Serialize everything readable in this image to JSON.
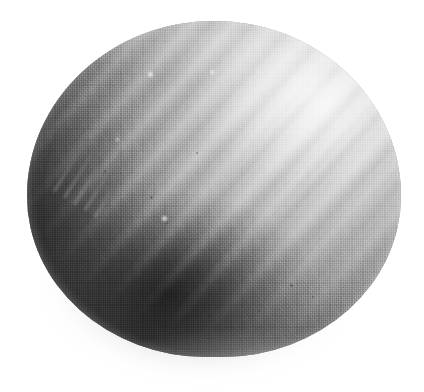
{
  "image": {
    "domain": "Natural-Image",
    "description": "Close-up photograph of a rounded dome-shaped object with a woven textile surface",
    "width": 424,
    "height": 392,
    "background_color": "#ffffff",
    "color_mode": "grayscale"
  },
  "subject": {
    "name": "textured dome object",
    "shape": "dome",
    "bounds": {
      "left": 27,
      "top": 21,
      "width": 374,
      "height": 336
    },
    "surface": "fine woven crosshatch mesh",
    "base_color": "#9a9a9a",
    "highlight_color": "#ececec",
    "shadow_color": "#2a2a2a",
    "deepest_shadow_color": "#121212"
  },
  "lighting": {
    "direction": "upper-right",
    "highlight_center": {
      "x": 310,
      "y": 92
    },
    "shadow_center": {
      "x": 165,
      "y": 292
    },
    "ambient_shadow_color": "#5a5a5a"
  },
  "ridges": {
    "count": 5,
    "angle_degrees": 132,
    "spacing_px": 31,
    "region": "upper-middle to right of the dome"
  },
  "markings": {
    "embossed_lines": 5,
    "legible": false,
    "location": "left flank",
    "rotation_degrees": -58
  },
  "speckles": [
    {
      "x": 150,
      "y": 196,
      "size": 3
    },
    {
      "x": 166,
      "y": 222,
      "size": 2
    },
    {
      "x": 290,
      "y": 284,
      "size": 3
    },
    {
      "x": 312,
      "y": 296,
      "size": 2
    },
    {
      "x": 196,
      "y": 152,
      "size": 2
    },
    {
      "x": 258,
      "y": 310,
      "size": 2
    },
    {
      "x": 104,
      "y": 170,
      "size": 2
    }
  ],
  "light_speckles": [
    {
      "x": 148,
      "y": 72,
      "size": 5
    },
    {
      "x": 210,
      "y": 70,
      "size": 4
    },
    {
      "x": 162,
      "y": 216,
      "size": 5
    },
    {
      "x": 116,
      "y": 138,
      "size": 3
    }
  ]
}
